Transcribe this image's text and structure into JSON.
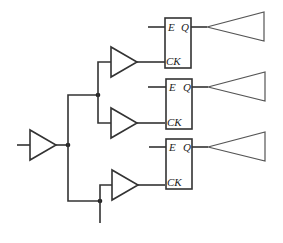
{
  "diagram": {
    "type": "clock-distribution-tree",
    "colors": {
      "line": "#333333",
      "background": "#ffffff"
    },
    "flip_flops": [
      {
        "id": "ff1",
        "enable_label": "E",
        "output_label": "Q",
        "clock_label": "CK"
      },
      {
        "id": "ff2",
        "enable_label": "E",
        "output_label": "Q",
        "clock_label": "CK"
      },
      {
        "id": "ff3",
        "enable_label": "E",
        "output_label": "Q",
        "clock_label": "CK"
      }
    ],
    "buffers": {
      "root": "input-buffer",
      "level2": [
        "buffer-upper-1",
        "buffer-upper-2",
        "buffer-lower"
      ]
    },
    "output_drivers": 3,
    "junction_dots": 3
  }
}
